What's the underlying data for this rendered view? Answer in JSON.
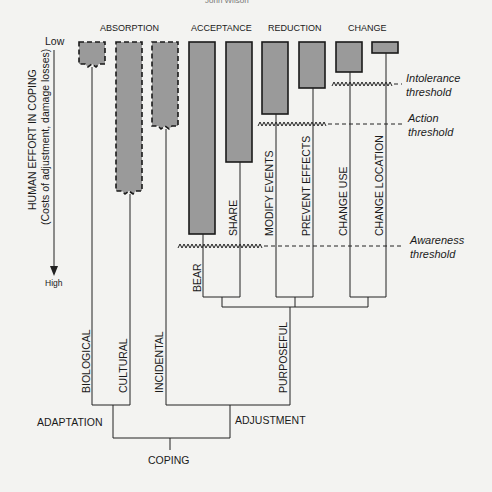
{
  "page_header_partial": "John Wilson",
  "axis": {
    "low_label": "Low",
    "high_label": "High",
    "title": "HUMAN EFFORT IN COPING",
    "subtitle": "(Costs of adjustment, damage losses)"
  },
  "categories": {
    "absorption": "ABSORPTION",
    "acceptance": "ACCEPTANCE",
    "reduction": "REDUCTION",
    "change": "CHANGE"
  },
  "branches": {
    "bear": "BEAR",
    "share": "SHARE",
    "modify_events": "MODIFY EVENTS",
    "prevent_effects": "PREVENT EFFECTS",
    "change_use": "CHANGE USE",
    "change_location": "CHANGE LOCATION",
    "biological": "BIOLOGICAL",
    "cultural": "CULTURAL",
    "incidental": "INCIDENTAL",
    "purposeful": "PURPOSEFUL",
    "adaptation": "ADAPTATION",
    "adjustment": "ADJUSTMENT",
    "coping": "COPING"
  },
  "thresholds": {
    "intolerance_1": "Intolerance",
    "intolerance_2": "threshold",
    "action_1": "Action",
    "action_2": "threshold",
    "awareness_1": "Awareness",
    "awareness_2": "threshold"
  },
  "colors": {
    "bar_fill": "#9a9a9a",
    "line": "#222222",
    "background": "#f3f3f1"
  }
}
